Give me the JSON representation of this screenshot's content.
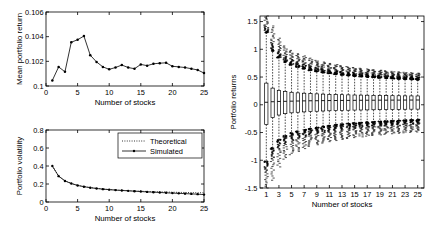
{
  "chart_data": [
    {
      "type": "line",
      "name": "mean-portfolio-return",
      "title": "",
      "xlabel": "Number of stocks",
      "ylabel": "Mean portfolio return",
      "xlim": [
        0,
        25
      ],
      "ylim": [
        0.1,
        0.106
      ],
      "xticks": [
        0,
        5,
        10,
        15,
        20,
        25
      ],
      "xticklabels": [
        "0",
        "5",
        "10",
        "15",
        "20",
        "25"
      ],
      "yticks": [
        0.1,
        0.102,
        0.104,
        0.106
      ],
      "yticklabels": [
        "0.1",
        "0.102",
        "0.104",
        "0.106"
      ],
      "grid": false,
      "legend": "none",
      "marker": "dot",
      "x": [
        1,
        2,
        3,
        4,
        5,
        6,
        7,
        8,
        9,
        10,
        11,
        12,
        13,
        14,
        15,
        16,
        17,
        18,
        19,
        20,
        21,
        22,
        23,
        24,
        25
      ],
      "values": [
        0.10045,
        0.10155,
        0.10115,
        0.10355,
        0.10375,
        0.10405,
        0.1025,
        0.10195,
        0.10155,
        0.10135,
        0.1015,
        0.1017,
        0.1015,
        0.1014,
        0.10175,
        0.10165,
        0.1018,
        0.10185,
        0.10188,
        0.1016,
        0.10155,
        0.1015,
        0.1014,
        0.1013,
        0.10105
      ]
    },
    {
      "type": "line",
      "name": "portfolio-volatility",
      "title": "",
      "xlabel": "Number of stocks",
      "ylabel": "Portfolio volatility",
      "xlim": [
        0,
        25
      ],
      "ylim": [
        0,
        0.8
      ],
      "xticks": [
        0,
        5,
        10,
        15,
        20,
        25
      ],
      "xticklabels": [
        "0",
        "5",
        "10",
        "15",
        "20",
        "25"
      ],
      "yticks": [
        0,
        0.2,
        0.4,
        0.6,
        0.8
      ],
      "yticklabels": [
        "0",
        "0.2",
        "0.4",
        "0.6",
        "0.8"
      ],
      "grid": false,
      "legend": "upper right",
      "legend_entries": [
        {
          "label": "Theoretical",
          "style": "dotted"
        },
        {
          "label": "Simulated",
          "style": "solid-marker"
        }
      ],
      "x": [
        1,
        2,
        3,
        4,
        5,
        6,
        7,
        8,
        9,
        10,
        11,
        12,
        13,
        14,
        15,
        16,
        17,
        18,
        19,
        20,
        21,
        22,
        23,
        24,
        25
      ],
      "series": [
        {
          "name": "Theoretical",
          "values": [
            0.4,
            0.288,
            0.237,
            0.207,
            0.186,
            0.172,
            0.161,
            0.152,
            0.145,
            0.139,
            0.134,
            0.13,
            0.126,
            0.123,
            0.12,
            0.117,
            0.115,
            0.113,
            0.111,
            0.109,
            0.107,
            0.106,
            0.104,
            0.103,
            0.102
          ]
        },
        {
          "name": "Simulated",
          "values": [
            0.4,
            0.287,
            0.234,
            0.205,
            0.184,
            0.17,
            0.159,
            0.15,
            0.143,
            0.137,
            0.132,
            0.128,
            0.124,
            0.12,
            0.116,
            0.112,
            0.109,
            0.106,
            0.102,
            0.099,
            0.096,
            0.093,
            0.09,
            0.087,
            0.082
          ]
        }
      ]
    },
    {
      "type": "boxplot",
      "name": "portfolio-returns-distribution",
      "title": "",
      "xlabel": "Number of stocks",
      "ylabel": "Portfolio returns",
      "xlim": [
        0,
        26
      ],
      "ylim": [
        -1.5,
        1.6
      ],
      "xticks": [
        1,
        3,
        5,
        7,
        9,
        11,
        13,
        15,
        17,
        19,
        21,
        23,
        25
      ],
      "xticklabels": [
        "1",
        "3",
        "5",
        "7",
        "9",
        "11",
        "13",
        "15",
        "17",
        "19",
        "21",
        "23",
        "25"
      ],
      "yticks": [
        -1.5,
        -1,
        -0.5,
        0,
        0.5,
        1,
        1.5
      ],
      "yticklabels": [
        "-1.5",
        "-1",
        "-0.5",
        "0",
        "0.5",
        "1",
        "1.5"
      ],
      "grid": false,
      "legend": "none",
      "boxes": [
        {
          "x": 1,
          "q1": -0.355,
          "median": 0.045,
          "q3": 0.39,
          "whisker_low": -1.02,
          "whisker_high": 1.3,
          "outlier_low": -1.5,
          "outlier_high": 1.6
        },
        {
          "x": 2,
          "q1": -0.23,
          "median": 0.055,
          "q3": 0.3,
          "whisker_low": -0.78,
          "whisker_high": 0.97,
          "outlier_low": -1.36,
          "outlier_high": 1.42
        },
        {
          "x": 3,
          "q1": -0.185,
          "median": 0.06,
          "q3": 0.26,
          "whisker_low": -0.63,
          "whisker_high": 0.85,
          "outlier_low": -1.12,
          "outlier_high": 1.2
        },
        {
          "x": 4,
          "q1": -0.16,
          "median": 0.062,
          "q3": 0.24,
          "whisker_low": -0.56,
          "whisker_high": 0.77,
          "outlier_low": -0.98,
          "outlier_high": 1.06
        },
        {
          "x": 5,
          "q1": -0.145,
          "median": 0.065,
          "q3": 0.225,
          "whisker_low": -0.51,
          "whisker_high": 0.72,
          "outlier_low": -0.9,
          "outlier_high": 0.98
        },
        {
          "x": 6,
          "q1": -0.135,
          "median": 0.068,
          "q3": 0.215,
          "whisker_low": -0.48,
          "whisker_high": 0.68,
          "outlier_low": -0.84,
          "outlier_high": 0.92
        },
        {
          "x": 7,
          "q1": -0.128,
          "median": 0.07,
          "q3": 0.208,
          "whisker_low": -0.45,
          "whisker_high": 0.65,
          "outlier_low": -0.79,
          "outlier_high": 0.88
        },
        {
          "x": 8,
          "q1": -0.122,
          "median": 0.072,
          "q3": 0.202,
          "whisker_low": -0.43,
          "whisker_high": 0.62,
          "outlier_low": -0.75,
          "outlier_high": 0.84
        },
        {
          "x": 9,
          "q1": -0.117,
          "median": 0.073,
          "q3": 0.197,
          "whisker_low": -0.41,
          "whisker_high": 0.6,
          "outlier_low": -0.72,
          "outlier_high": 0.8
        },
        {
          "x": 10,
          "q1": -0.112,
          "median": 0.075,
          "q3": 0.192,
          "whisker_low": -0.39,
          "whisker_high": 0.58,
          "outlier_low": -0.69,
          "outlier_high": 0.77
        },
        {
          "x": 11,
          "q1": -0.108,
          "median": 0.076,
          "q3": 0.188,
          "whisker_low": -0.375,
          "whisker_high": 0.565,
          "outlier_low": -0.665,
          "outlier_high": 0.745
        },
        {
          "x": 12,
          "q1": -0.105,
          "median": 0.077,
          "q3": 0.185,
          "whisker_low": -0.36,
          "whisker_high": 0.55,
          "outlier_low": -0.645,
          "outlier_high": 0.725
        },
        {
          "x": 13,
          "q1": -0.102,
          "median": 0.078,
          "q3": 0.182,
          "whisker_low": -0.35,
          "whisker_high": 0.538,
          "outlier_low": -0.625,
          "outlier_high": 0.705
        },
        {
          "x": 14,
          "q1": -0.099,
          "median": 0.079,
          "q3": 0.179,
          "whisker_low": -0.34,
          "whisker_high": 0.527,
          "outlier_low": -0.608,
          "outlier_high": 0.688
        },
        {
          "x": 15,
          "q1": -0.096,
          "median": 0.08,
          "q3": 0.176,
          "whisker_low": -0.33,
          "whisker_high": 0.517,
          "outlier_low": -0.592,
          "outlier_high": 0.672
        },
        {
          "x": 16,
          "q1": -0.094,
          "median": 0.081,
          "q3": 0.174,
          "whisker_low": -0.322,
          "whisker_high": 0.508,
          "outlier_low": -0.578,
          "outlier_high": 0.658
        },
        {
          "x": 17,
          "q1": -0.092,
          "median": 0.082,
          "q3": 0.172,
          "whisker_low": -0.314,
          "whisker_high": 0.5,
          "outlier_low": -0.565,
          "outlier_high": 0.645
        },
        {
          "x": 18,
          "q1": -0.09,
          "median": 0.082,
          "q3": 0.17,
          "whisker_low": -0.307,
          "whisker_high": 0.492,
          "outlier_low": -0.553,
          "outlier_high": 0.633
        },
        {
          "x": 19,
          "q1": -0.088,
          "median": 0.083,
          "q3": 0.168,
          "whisker_low": -0.3,
          "whisker_high": 0.485,
          "outlier_low": -0.542,
          "outlier_high": 0.622
        },
        {
          "x": 20,
          "q1": -0.086,
          "median": 0.083,
          "q3": 0.166,
          "whisker_low": -0.294,
          "whisker_high": 0.478,
          "outlier_low": -0.532,
          "outlier_high": 0.612
        },
        {
          "x": 21,
          "q1": -0.084,
          "median": 0.084,
          "q3": 0.164,
          "whisker_low": -0.288,
          "whisker_high": 0.472,
          "outlier_low": -0.522,
          "outlier_high": 0.602
        },
        {
          "x": 22,
          "q1": -0.083,
          "median": 0.084,
          "q3": 0.163,
          "whisker_low": -0.283,
          "whisker_high": 0.466,
          "outlier_low": -0.513,
          "outlier_high": 0.593
        },
        {
          "x": 23,
          "q1": -0.081,
          "median": 0.085,
          "q3": 0.161,
          "whisker_low": -0.278,
          "whisker_high": 0.461,
          "outlier_low": -0.505,
          "outlier_high": 0.585
        },
        {
          "x": 24,
          "q1": -0.08,
          "median": 0.085,
          "q3": 0.16,
          "whisker_low": -0.273,
          "whisker_high": 0.456,
          "outlier_low": -0.497,
          "outlier_high": 0.577
        },
        {
          "x": 25,
          "q1": -0.079,
          "median": 0.086,
          "q3": 0.159,
          "whisker_low": -0.268,
          "whisker_high": 0.451,
          "outlier_low": -0.49,
          "outlier_high": 0.57
        }
      ]
    }
  ]
}
